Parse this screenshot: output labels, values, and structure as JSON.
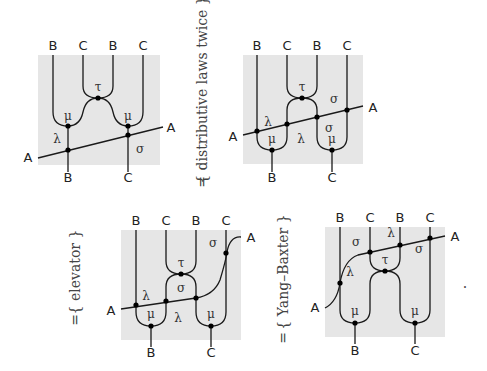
{
  "colors": {
    "panel_bg": "#e6e6e6",
    "wire": "#1a1a1a",
    "node": "#000000"
  },
  "panels": [
    {
      "id": "panel-1",
      "top_labels": [
        "B",
        "C",
        "B",
        "C"
      ],
      "bottom_labels": [
        "B",
        "C"
      ],
      "side_labels": {
        "left": "A",
        "right": "A"
      },
      "nodes": [
        "τ",
        "μ",
        "μ",
        "λ",
        "σ"
      ]
    },
    {
      "id": "panel-2",
      "top_labels": [
        "B",
        "C",
        "B",
        "C"
      ],
      "bottom_labels": [
        "B",
        "C"
      ],
      "side_labels": {
        "left": "A",
        "right": "A"
      },
      "nodes": [
        "τ",
        "σ",
        "λ",
        "μ",
        "λ",
        "σ",
        "μ"
      ]
    },
    {
      "id": "panel-3",
      "top_labels": [
        "B",
        "C",
        "B",
        "C"
      ],
      "bottom_labels": [
        "B",
        "C"
      ],
      "side_labels": {
        "left": "A",
        "right": "A"
      },
      "nodes": [
        "σ",
        "τ",
        "σ",
        "λ",
        "μ",
        "λ",
        "μ"
      ]
    },
    {
      "id": "panel-4",
      "top_labels": [
        "B",
        "C",
        "B",
        "C"
      ],
      "bottom_labels": [
        "B",
        "C"
      ],
      "side_labels": {
        "left": "A",
        "right": "A"
      },
      "nodes": [
        "σ",
        "λ",
        "σ",
        "τ",
        "λ",
        "μ",
        "μ"
      ]
    }
  ],
  "relations": [
    {
      "symbol": "=",
      "justification": "{ distributive laws twice }"
    },
    {
      "symbol": "=",
      "justification": "{ elevator }"
    },
    {
      "symbol": "=",
      "justification": "{ Yang–Baxter }"
    }
  ],
  "trailing_punctuation": "."
}
